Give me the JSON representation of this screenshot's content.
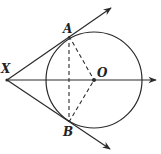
{
  "diagram": {
    "points": {
      "X": {
        "label": "X",
        "x": 7,
        "y": 80
      },
      "A": {
        "label": "A",
        "x": 69,
        "y": 36
      },
      "B": {
        "label": "B",
        "x": 69,
        "y": 122
      },
      "O": {
        "label": "O",
        "x": 94,
        "y": 80
      }
    },
    "circle": {
      "center": "O",
      "cx": 94,
      "cy": 80,
      "r": 48
    },
    "rays": [
      {
        "name": "tangent-XA",
        "from": "X",
        "through": "A",
        "end": {
          "x": 111,
          "y": 8
        }
      },
      {
        "name": "tangent-XB",
        "from": "X",
        "through": "B",
        "end": {
          "x": 110,
          "y": 149
        }
      },
      {
        "name": "axis-XO",
        "from": "X",
        "through": "O",
        "end": {
          "x": 156,
          "y": 80
        }
      }
    ],
    "dashed_segments": [
      {
        "name": "chord-AB",
        "from": "A",
        "to": "B"
      },
      {
        "name": "radius-AO",
        "from": "A",
        "to": "O"
      },
      {
        "name": "radius-BO",
        "from": "B",
        "to": "O"
      }
    ],
    "colors": {
      "stroke": "#2a2a2a",
      "background": "#ffffff"
    }
  }
}
